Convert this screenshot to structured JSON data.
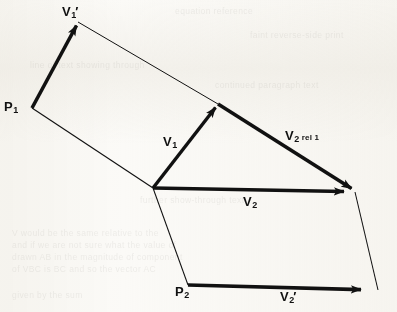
{
  "figure": {
    "type": "vector-diagram",
    "width": 397,
    "height": 312,
    "background_color": "#fbfaf7",
    "ink_color": "#111111"
  },
  "points": {
    "p1": {
      "x": 32,
      "y": 108
    },
    "v1_prime_tip": {
      "x": 78,
      "y": 22
    },
    "v1_tip": {
      "x": 218,
      "y": 104
    },
    "origin": {
      "x": 153,
      "y": 188
    },
    "convergence": {
      "x": 355,
      "y": 192
    },
    "p2": {
      "x": 188,
      "y": 285
    },
    "lower_right": {
      "x": 378,
      "y": 290
    }
  },
  "vectors": [
    {
      "id": "v1-prime",
      "label": "V1'",
      "from": "p1",
      "to": "v1_prime_tip",
      "weight": "thick",
      "arrow": true
    },
    {
      "id": "v1",
      "label": "V1",
      "from": "origin",
      "to": "v1_tip",
      "weight": "thick",
      "arrow": true
    },
    {
      "id": "v2-rel-1",
      "label": "V2 rel 1",
      "from": "v1_tip",
      "to": "convergence",
      "weight": "thick",
      "arrow": true
    },
    {
      "id": "v2",
      "label": "V2",
      "from": "origin",
      "to": "convergence",
      "weight": "thick",
      "arrow": true
    },
    {
      "id": "v2-prime",
      "label": "V2'",
      "from": "p2",
      "to": "lower_right",
      "weight": "thick",
      "arrow": true
    }
  ],
  "construction_lines": [
    {
      "id": "upper-top",
      "from": "v1_prime_tip",
      "to": "v1_tip"
    },
    {
      "id": "upper-bottom",
      "from": "p1",
      "to": "origin"
    },
    {
      "id": "lower-left",
      "from": "origin",
      "to": "p2"
    },
    {
      "id": "lower-right",
      "from": "convergence",
      "to": "lower_right"
    }
  ],
  "labels": {
    "v1_prime": {
      "base": "V",
      "sub": "1",
      "prime": "′",
      "x": 62,
      "y": 3
    },
    "p1": {
      "base": "P",
      "sub": "1",
      "x": 4,
      "y": 98
    },
    "v1": {
      "base": "V",
      "sub": "1",
      "x": 163,
      "y": 133
    },
    "v2_rel_1": {
      "base": "V",
      "sub": "2",
      "rel": "rel 1",
      "x": 285,
      "y": 127
    },
    "v2": {
      "base": "V",
      "sub": "2",
      "x": 243,
      "y": 193
    },
    "p2": {
      "base": "P",
      "sub": "2",
      "x": 175,
      "y": 283
    },
    "v2_prime": {
      "base": "V",
      "sub": "2",
      "prime": "′",
      "x": 280,
      "y": 288
    }
  },
  "ghost_text": [
    {
      "text": "equation reference",
      "x": 175,
      "y": 6
    },
    {
      "text": "faint reverse-side print",
      "x": 250,
      "y": 30
    },
    {
      "text": "line of text showing through",
      "x": 30,
      "y": 60
    },
    {
      "text": "continued paragraph text",
      "x": 215,
      "y": 80
    },
    {
      "text": "further show-through text",
      "x": 140,
      "y": 195
    },
    {
      "text": "V would be the same relative to the",
      "x": 12,
      "y": 228
    },
    {
      "text": "and if we are not sure what the value of",
      "x": 12,
      "y": 240
    },
    {
      "text": "drawn AB in the magnitude of component",
      "x": 12,
      "y": 252
    },
    {
      "text": "of VBC is BC and so the vector AC",
      "x": 12,
      "y": 264
    },
    {
      "text": "given by the sum",
      "x": 12,
      "y": 290
    }
  ]
}
